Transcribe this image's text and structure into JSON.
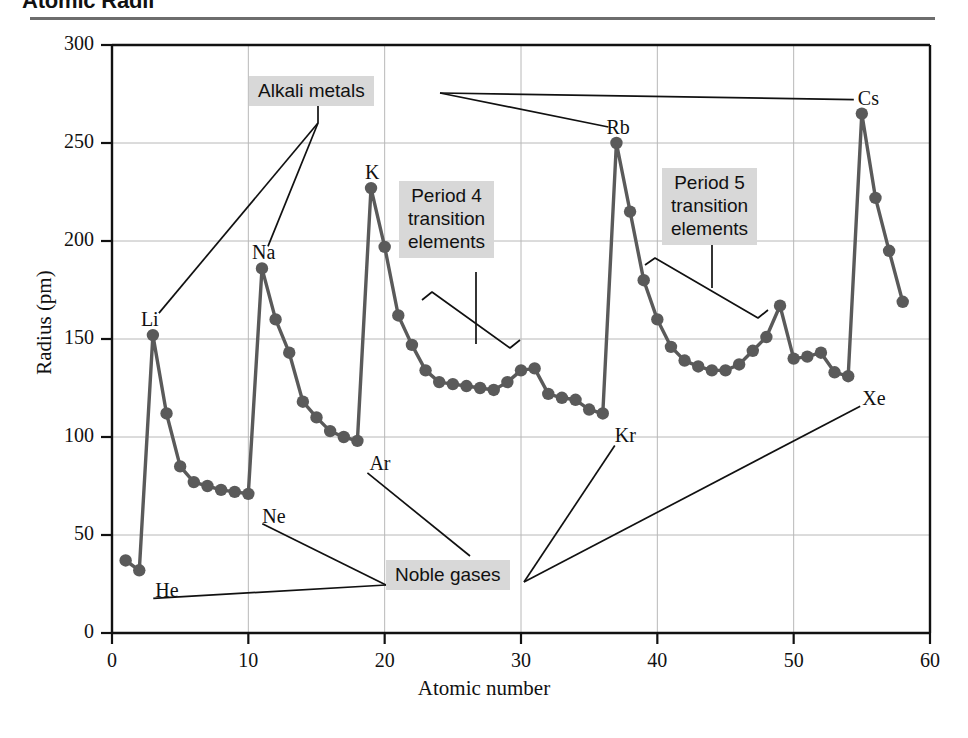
{
  "header": {
    "title": "Atomic Radii"
  },
  "axes": {
    "xlabel": "Atomic number",
    "ylabel": "Radius (pm)",
    "xticks": [
      "0",
      "10",
      "20",
      "30",
      "40",
      "50",
      "60"
    ],
    "yticks": [
      "0",
      "50",
      "100",
      "150",
      "200",
      "250",
      "300"
    ]
  },
  "annotations": [
    {
      "id": "alkali",
      "text": "Alkali metals"
    },
    {
      "id": "period4",
      "text": "Period 4\ntransition\nelements"
    },
    {
      "id": "period5",
      "text": "Period 5\ntransition\nelements"
    },
    {
      "id": "noble",
      "text": "Noble gases"
    }
  ],
  "point_labels": [
    {
      "text": "He",
      "x": 2,
      "y": 32,
      "dx": 16,
      "dy": 22
    },
    {
      "text": "Li",
      "x": 3,
      "y": 152,
      "dx": -12,
      "dy": -14
    },
    {
      "text": "Ne",
      "x": 10,
      "y": 71,
      "dx": 14,
      "dy": 24
    },
    {
      "text": "Na",
      "x": 11,
      "y": 186,
      "dx": -10,
      "dy": -14
    },
    {
      "text": "Ar",
      "x": 18,
      "y": 98,
      "dx": 12,
      "dy": 24
    },
    {
      "text": "K",
      "x": 19,
      "y": 227,
      "dx": -6,
      "dy": -14
    },
    {
      "text": "Kr",
      "x": 36,
      "y": 112,
      "dx": 12,
      "dy": 24
    },
    {
      "text": "Rb",
      "x": 37,
      "y": 250,
      "dx": -10,
      "dy": -14
    },
    {
      "text": "Xe",
      "x": 54,
      "y": 131,
      "dx": 14,
      "dy": 24
    },
    {
      "text": "Cs",
      "x": 55,
      "y": 265,
      "dx": -4,
      "dy": -14
    }
  ],
  "colors": {
    "series": "#5a5a5a",
    "grid": "#b8b8b8",
    "axis": "#111111",
    "callout_bg": "#d8d8d8",
    "rule": "#6d6d6d"
  },
  "chart_data": {
    "type": "line",
    "title": "Atomic Radii",
    "xlabel": "Atomic number",
    "ylabel": "Radius (pm)",
    "xlim": [
      0,
      60
    ],
    "ylim": [
      0,
      300
    ],
    "grid": true,
    "legend": "none",
    "markers": "filled-circle",
    "series": [
      {
        "name": "Atomic radius",
        "x": [
          1,
          2,
          3,
          4,
          5,
          6,
          7,
          8,
          9,
          10,
          11,
          12,
          13,
          14,
          15,
          16,
          17,
          18,
          19,
          20,
          21,
          22,
          23,
          24,
          25,
          26,
          27,
          28,
          29,
          30,
          31,
          32,
          33,
          34,
          35,
          36,
          37,
          38,
          39,
          40,
          41,
          42,
          43,
          44,
          45,
          46,
          47,
          48,
          49,
          50,
          51,
          52,
          53,
          54,
          55,
          56,
          57,
          58
        ],
        "values": [
          37,
          32,
          152,
          112,
          85,
          77,
          75,
          73,
          72,
          71,
          186,
          160,
          143,
          118,
          110,
          103,
          100,
          98,
          227,
          197,
          162,
          147,
          134,
          128,
          127,
          126,
          125,
          124,
          128,
          134,
          135,
          122,
          120,
          119,
          114,
          112,
          250,
          215,
          180,
          160,
          146,
          139,
          136,
          134,
          134,
          137,
          144,
          151,
          167,
          140,
          141,
          143,
          133,
          131,
          265,
          222,
          195,
          169
        ],
        "element_symbols": [
          "H",
          "He",
          "Li",
          "Be",
          "B",
          "C",
          "N",
          "O",
          "F",
          "Ne",
          "Na",
          "Mg",
          "Al",
          "Si",
          "P",
          "S",
          "Cl",
          "Ar",
          "K",
          "Ca",
          "Sc",
          "Ti",
          "V",
          "Cr",
          "Mn",
          "Fe",
          "Co",
          "Ni",
          "Cu",
          "Zn",
          "Ga",
          "Ge",
          "As",
          "Se",
          "Br",
          "Kr",
          "Rb",
          "Sr",
          "Y",
          "Zr",
          "Nb",
          "Mo",
          "Tc",
          "Ru",
          "Rh",
          "Pd",
          "Ag",
          "Cd",
          "In",
          "Sn",
          "Sb",
          "Te",
          "I",
          "Xe",
          "Cs",
          "Ba",
          "La",
          "Ce"
        ]
      }
    ]
  }
}
